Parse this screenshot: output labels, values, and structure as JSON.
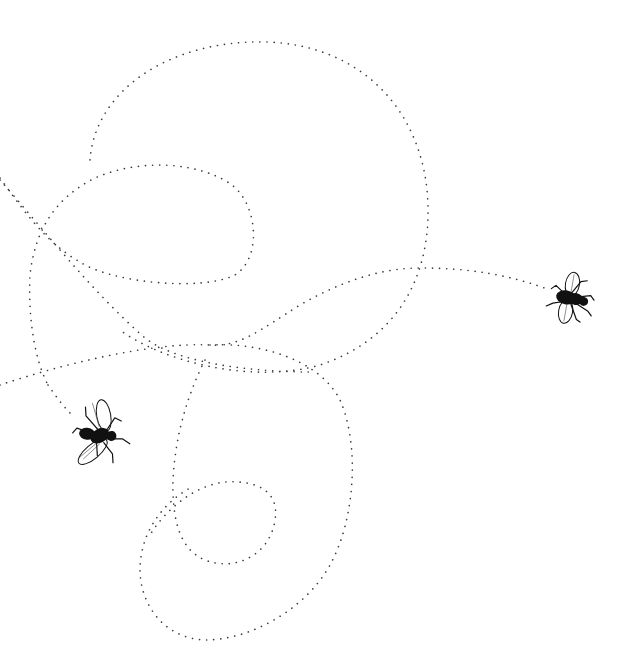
{
  "illustration": {
    "subject": "Two flies with dotted looping flight paths",
    "style": "pen-and-ink line drawing on white",
    "background_color": "#ffffff",
    "ink_color": "#111111",
    "path_color": "#3a3a3a",
    "flies": [
      {
        "name": "fly-left",
        "position": [
          97,
          435
        ],
        "rotation_deg": -30
      },
      {
        "name": "fly-right",
        "position": [
          570,
          298
        ],
        "rotation_deg": 10
      }
    ],
    "flight_path_loops": [
      {
        "name": "large-upper-loop",
        "center": [
          258,
          205
        ],
        "rx": 170,
        "ry": 165
      },
      {
        "name": "small-inner-loop",
        "center": [
          145,
          225
        ],
        "rx": 108,
        "ry": 63
      },
      {
        "name": "lower-large-loop",
        "center": [
          265,
          485
        ],
        "rx": 88,
        "ry": 145
      },
      {
        "name": "lower-small-loop",
        "center": [
          228,
          525
        ],
        "rx": 50,
        "ry": 43
      },
      {
        "name": "bottom-loop",
        "center": [
          215,
          580
        ],
        "rx": 80,
        "ry": 65
      }
    ]
  }
}
